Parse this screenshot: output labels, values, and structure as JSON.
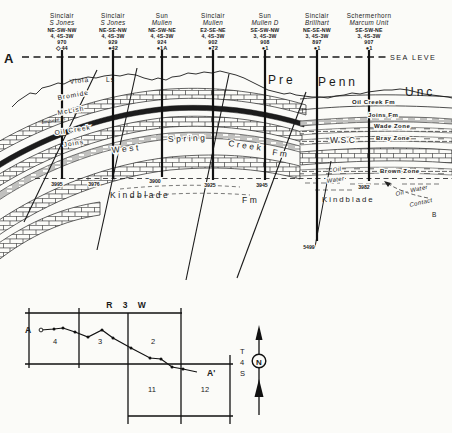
{
  "xsec": {
    "a_label": "A",
    "sea_level": "SEA LEVE",
    "pre": "Pre",
    "penn": "Penn",
    "unc": "Unc",
    "viola": "Viola",
    "viola_ls": "Ls",
    "bromide": "Bromide",
    "mclish": "McLish",
    "birdseye": "Birdseye Ls",
    "oil_creek": "Oil Creek",
    "joins": "Joins",
    "west": "West",
    "spring": "Spring",
    "creek": "Creek",
    "fm_west_spring": "Fm",
    "fm_lower": "Fm",
    "wsc": "WSC",
    "kindblade_left": "Kindblade",
    "kindblade_right": "Kindblade",
    "oil_creek_fm": "Oil Creek Fm",
    "joins_fm": "Joins Fm",
    "wade_zone": "Wade Zone",
    "bray_zone": "Bray Zone",
    "brown_zone": "Brown Zone",
    "oil_italic": "Oil",
    "water_italic": "Water",
    "owc_line1": "Oil - Water",
    "owc_line2": "Contact",
    "b_label": "B"
  },
  "wells": [
    {
      "company": "Sinclair",
      "lease": "S Jones",
      "location": "NE-SW-NW",
      "str": "4, 4S-3W",
      "elevation": "970",
      "symbol": "◇",
      "well_no": "44",
      "td": "3995"
    },
    {
      "company": "Sinclair",
      "lease": "S Jones",
      "location": "NE-SE-NW",
      "str": "4, 4S-3W",
      "elevation": "929",
      "symbol": "●",
      "well_no": "42",
      "td": "3976"
    },
    {
      "company": "Sun",
      "lease": "Mullen",
      "location": "NE-SW-NE",
      "str": "4, 4S-3W",
      "elevation": "924",
      "symbol": "●",
      "well_no": "1A",
      "td": "3900"
    },
    {
      "company": "Sinclair",
      "lease": "Mullen",
      "location": "E2-SE-NE",
      "str": "4, 4S-3W",
      "elevation": "902",
      "symbol": "●",
      "well_no": "72",
      "td": "3925"
    },
    {
      "company": "Sun",
      "lease": "Mullen D",
      "location": "SE-SW-NW",
      "str": "3, 4S-3W",
      "elevation": "908",
      "symbol": "●",
      "well_no": "1",
      "td": "3945"
    },
    {
      "company": "Sinclair",
      "lease": "Brillhart",
      "location": "NE-SE-NW",
      "str": "3, 4S-3W",
      "elevation": "897",
      "symbol": "●",
      "well_no": "1",
      "td": "5499"
    },
    {
      "company": "Schermerhorn",
      "lease": "Marcum Unit",
      "location": "SE-SW-NE",
      "str": "3, 4S-3W",
      "elevation": "907",
      "symbol": "●",
      "well_no": "1",
      "td": "3982"
    }
  ],
  "map": {
    "range": "R 3 W",
    "township_t": "T",
    "township_4": "4",
    "township_s": "S",
    "sections": {
      "s4": "4",
      "s3": "3",
      "s2": "2",
      "s11": "11",
      "s12": "12"
    },
    "a": "A",
    "a_prime": "A'",
    "north": "N"
  }
}
